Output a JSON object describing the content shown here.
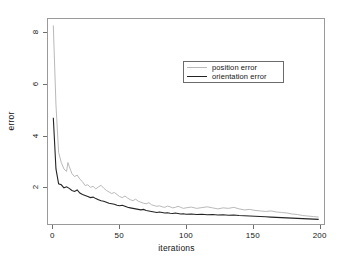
{
  "chart_data": {
    "type": "line",
    "title": "",
    "xlabel": "iterations",
    "ylabel": "error",
    "xlim": [
      -4,
      204
    ],
    "ylim": [
      0.55,
      8.55
    ],
    "xticks": [
      0,
      50,
      100,
      150,
      200
    ],
    "yticks": [
      2,
      4,
      6,
      8
    ],
    "xtick_labels": [
      "0",
      "50",
      "100",
      "150",
      "200"
    ],
    "ytick_labels": [
      "2",
      "4",
      "6",
      "8"
    ],
    "grid": false,
    "legend_position": "upper center",
    "series": [
      {
        "name": "position error",
        "color": "#b9b9b9",
        "x": [
          0,
          2,
          4,
          6,
          8,
          10,
          11,
          12,
          14,
          16,
          18,
          20,
          22,
          24,
          26,
          28,
          30,
          32,
          34,
          36,
          38,
          40,
          42,
          44,
          46,
          48,
          50,
          52,
          54,
          56,
          58,
          60,
          62,
          64,
          66,
          68,
          70,
          72,
          74,
          76,
          78,
          80,
          82,
          84,
          86,
          88,
          90,
          92,
          94,
          96,
          98,
          100,
          104,
          108,
          112,
          116,
          120,
          124,
          128,
          132,
          136,
          140,
          144,
          148,
          152,
          156,
          160,
          164,
          168,
          172,
          176,
          180,
          184,
          188,
          192,
          196,
          200
        ],
        "values": [
          8.3,
          5.2,
          3.35,
          2.95,
          2.7,
          2.6,
          2.95,
          2.8,
          2.52,
          2.4,
          2.46,
          2.3,
          2.2,
          2.05,
          2.08,
          1.98,
          2.02,
          1.92,
          2.0,
          2.06,
          1.95,
          1.86,
          1.8,
          1.74,
          1.78,
          1.7,
          1.62,
          1.58,
          1.64,
          1.56,
          1.5,
          1.46,
          1.52,
          1.44,
          1.4,
          1.36,
          1.34,
          1.38,
          1.3,
          1.27,
          1.24,
          1.26,
          1.22,
          1.2,
          1.25,
          1.22,
          1.18,
          1.2,
          1.24,
          1.2,
          1.16,
          1.18,
          1.21,
          1.16,
          1.19,
          1.22,
          1.18,
          1.14,
          1.18,
          1.16,
          1.2,
          1.14,
          1.1,
          1.12,
          1.08,
          1.06,
          1.04,
          1.06,
          1.02,
          1.0,
          0.98,
          0.94,
          0.92,
          0.88,
          0.86,
          0.84,
          0.82
        ]
      },
      {
        "name": "orientation error",
        "color": "#232323",
        "x": [
          0,
          2,
          4,
          6,
          8,
          10,
          12,
          14,
          16,
          18,
          20,
          22,
          24,
          26,
          28,
          30,
          32,
          34,
          36,
          38,
          40,
          42,
          44,
          46,
          48,
          50,
          52,
          54,
          56,
          58,
          60,
          62,
          64,
          66,
          68,
          70,
          72,
          74,
          76,
          78,
          80,
          82,
          84,
          86,
          88,
          90,
          92,
          94,
          96,
          98,
          100,
          104,
          108,
          112,
          116,
          120,
          124,
          128,
          132,
          136,
          140,
          144,
          148,
          152,
          156,
          160,
          164,
          168,
          172,
          176,
          180,
          184,
          188,
          192,
          196,
          200
        ],
        "values": [
          4.7,
          2.7,
          2.12,
          2.08,
          1.96,
          2.0,
          1.94,
          1.86,
          1.82,
          1.88,
          1.76,
          1.7,
          1.66,
          1.62,
          1.58,
          1.6,
          1.54,
          1.5,
          1.46,
          1.44,
          1.4,
          1.36,
          1.34,
          1.32,
          1.28,
          1.26,
          1.28,
          1.24,
          1.2,
          1.18,
          1.16,
          1.14,
          1.12,
          1.1,
          1.12,
          1.08,
          1.06,
          1.04,
          1.02,
          1.0,
          1.02,
          1.0,
          0.98,
          0.99,
          0.97,
          0.96,
          0.98,
          0.96,
          0.94,
          0.95,
          0.93,
          0.94,
          0.92,
          0.93,
          0.91,
          0.92,
          0.9,
          0.91,
          0.89,
          0.9,
          0.88,
          0.87,
          0.86,
          0.85,
          0.84,
          0.83,
          0.82,
          0.81,
          0.8,
          0.79,
          0.78,
          0.77,
          0.76,
          0.75,
          0.74,
          0.73
        ]
      }
    ]
  },
  "legend": {
    "items": [
      {
        "label": "position error"
      },
      {
        "label": "orientation error"
      }
    ]
  }
}
